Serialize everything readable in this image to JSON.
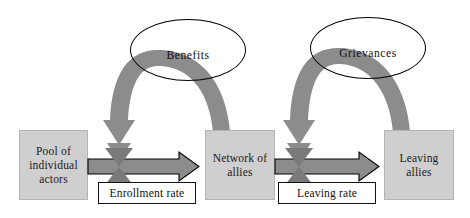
{
  "diagram": {
    "type": "system-dynamics-stock-and-flow",
    "colors": {
      "stock_fill": "#cfcfcf",
      "stock_border": "#b4b4b4",
      "flow_arrow_fill": "#8c8c8c",
      "flow_arrow_border": "#000000",
      "curved_arrow_fill": "#8c8c8c",
      "valve_fill": "#8c8c8c",
      "ellipse_border": "#000000",
      "rate_box_fill": "#ffffff",
      "rate_box_border": "#111111",
      "background": "#ffffff",
      "text": "#111111"
    },
    "stocks": [
      {
        "id": "pool",
        "label": "Pool of\nindividual\nactors"
      },
      {
        "id": "network",
        "label": "Network of\nallies"
      },
      {
        "id": "leaving",
        "label": "Leaving\nallies"
      }
    ],
    "flows": [
      {
        "id": "enrollment",
        "label": "Enrollment rate",
        "from": "pool",
        "to": "network"
      },
      {
        "id": "leaving-rate",
        "label": "Leaving rate",
        "from": "network",
        "to": "leaving"
      }
    ],
    "variables": [
      {
        "id": "benefits",
        "label": "Benefits"
      },
      {
        "id": "grievances",
        "label": "Grievances"
      }
    ],
    "influences": [
      {
        "from": "network",
        "through": "benefits",
        "to": "enrollment"
      },
      {
        "from": "leaving",
        "through": "grievances",
        "to": "leaving-rate"
      }
    ]
  }
}
